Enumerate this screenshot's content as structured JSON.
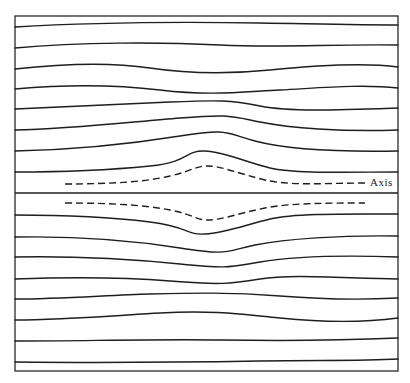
{
  "diagram": {
    "type": "streamline-flow-diagram",
    "axis_label": "Axis",
    "colors": {
      "line": "#1e1e1e",
      "background": "#ffffff"
    },
    "frame": {
      "x": 15,
      "y": 16,
      "width": 383,
      "height": 355
    },
    "axis_line": {
      "y": 193
    },
    "streamlines_above": [
      "M15,27 C100,22 200,22 260,23 S360,25 398,25",
      "M15,48 C80,42 160,42 220,45 S330,44 398,45",
      "M15,69 C60,64 110,62 150,68 S230,74 270,70 S360,62 398,67",
      "M15,89 C60,85 110,84 160,90 S240,92 280,90 S360,84 398,88",
      "M15,109 C70,107 120,104 170,102 S230,100 260,106 S340,110 398,108",
      "M15,130 C70,129 130,122 180,118 S230,116 260,122 S340,132 398,130",
      "M15,151 C70,150 130,144 180,136 S225,133 255,141 S340,152 398,151",
      "M15,172 C60,172 110,170 150,166 S185,150 205,151 S245,162 270,168 S350,172 398,172"
    ],
    "dashed_above": "M65,184 C110,184 145,182 170,176 S195,166 208,166 S240,174 265,180 S330,183 365,183",
    "dashed_below": "M65,203 C110,203 145,205 170,210 S195,220 208,220 S240,213 265,208 S330,203 365,203",
    "streamlines_below": [
      "M15,215 C60,215 110,217 150,222 S185,235 205,234 S245,225 270,219 S350,214 398,214",
      "M15,237 C70,236 130,240 180,248 S225,251 255,245 S340,235 398,236",
      "M15,257 C70,256 130,259 180,264 S230,267 260,262 S340,255 398,257",
      "M15,279 C70,277 120,277 170,281 S230,284 260,279 S340,278 398,279",
      "M15,299 C60,299 110,295 150,294 S230,292 280,296 S360,300 398,298",
      "M15,320 C60,320 110,316 160,313 S240,314 280,318 S360,323 398,318",
      "M15,341 C80,341 160,339 220,340 S330,341 398,338",
      "M15,362 C100,363 200,362 260,361 S360,361 398,359"
    ],
    "axis_label_pos": {
      "x": 370,
      "y": 186
    }
  }
}
